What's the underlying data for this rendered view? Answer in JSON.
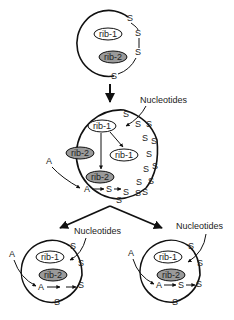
{
  "diagram": {
    "type": "biological-replication-schematic",
    "labels": {
      "rib1": "rib-1",
      "rib2": "rib-2",
      "nucleotides": "Nucleotides",
      "a": "A",
      "s": "S"
    },
    "stages": [
      {
        "name": "initial-cell",
        "contents": [
          "rib-1",
          "rib-2"
        ],
        "s_count_on_membrane": 4
      },
      {
        "name": "growing-cell",
        "contents": [
          "rib-1",
          "rib-2",
          "rib-1 (copy)",
          "rib-2 (copy)"
        ],
        "inputs": [
          "Nucleotides",
          "A"
        ],
        "chain": [
          "A",
          "S",
          "S"
        ]
      },
      {
        "name": "daughter-cell-left",
        "contents": [
          "rib-1",
          "rib-2"
        ],
        "inputs": [
          "Nucleotides",
          "A"
        ],
        "chain": [
          "A",
          "S"
        ]
      },
      {
        "name": "daughter-cell-right",
        "contents": [
          "rib-1",
          "rib-2"
        ],
        "inputs": [
          "Nucleotides",
          "A"
        ],
        "chain": [
          "A",
          "S",
          "S"
        ]
      }
    ],
    "colors": {
      "line": "#111111",
      "rib2_fill": "#9a9a9a",
      "rib1_fill": "#ffffff",
      "background": "#ffffff"
    }
  }
}
